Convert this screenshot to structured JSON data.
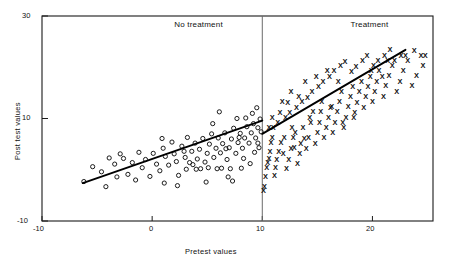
{
  "chart_data": {
    "type": "scatter",
    "title": "",
    "xlabel": "Pretest values",
    "ylabel": "Post test values",
    "xlim": [
      -10,
      25.5
    ],
    "ylim": [
      -10,
      30
    ],
    "xticks": [
      -10,
      0,
      10,
      20
    ],
    "xtick_labels": [
      "-10",
      "0",
      "10",
      "20"
    ],
    "yticks": [
      -10,
      10,
      30
    ],
    "ytick_labels": [
      "-10",
      "10",
      "30"
    ],
    "grid": false,
    "legend": "none",
    "cutoff": {
      "x": 10,
      "label": "vertical-cutoff-line"
    },
    "panels": [
      {
        "name": "No treatment",
        "label": "No treatment",
        "label_x": 2.0,
        "label_y": 28.2,
        "marker": "circle"
      },
      {
        "name": "Treatment",
        "label": "Treatment",
        "label_x": 18.0,
        "label_y": 28.2,
        "marker": "x"
      }
    ],
    "series": [
      {
        "name": "No treatment",
        "marker": "o",
        "points": [
          [
            -6.2,
            -2.3
          ],
          [
            -5.4,
            0.6
          ],
          [
            -4.6,
            -0.4
          ],
          [
            -4.2,
            -3.3
          ],
          [
            -3.4,
            1.1
          ],
          [
            -3.2,
            -1.4
          ],
          [
            -2.6,
            2.2
          ],
          [
            -2.2,
            -0.9
          ],
          [
            -1.8,
            1.4
          ],
          [
            -1.5,
            -2.0
          ],
          [
            -1.2,
            3.4
          ],
          [
            -0.9,
            0.4
          ],
          [
            -0.6,
            2.0
          ],
          [
            -0.2,
            -1.3
          ],
          [
            0.1,
            3.2
          ],
          [
            0.4,
            1.1
          ],
          [
            0.7,
            -0.2
          ],
          [
            1.0,
            4.2
          ],
          [
            1.2,
            2.6
          ],
          [
            1.5,
            0.9
          ],
          [
            1.8,
            5.4
          ],
          [
            2.0,
            3.1
          ],
          [
            2.2,
            1.6
          ],
          [
            2.4,
            -1.1
          ],
          [
            2.7,
            4.6
          ],
          [
            3.0,
            2.4
          ],
          [
            3.2,
            6.3
          ],
          [
            3.4,
            1.4
          ],
          [
            3.6,
            3.6
          ],
          [
            3.9,
            5.2
          ],
          [
            4.1,
            2.1
          ],
          [
            4.3,
            4.0
          ],
          [
            4.6,
            6.1
          ],
          [
            4.8,
            1.5
          ],
          [
            5.0,
            3.2
          ],
          [
            5.2,
            5.0
          ],
          [
            5.4,
            7.0
          ],
          [
            5.6,
            2.4
          ],
          [
            5.8,
            4.2
          ],
          [
            6.0,
            6.2
          ],
          [
            6.2,
            3.3
          ],
          [
            6.4,
            5.1
          ],
          [
            6.6,
            7.2
          ],
          [
            6.8,
            2.0
          ],
          [
            7.0,
            4.3
          ],
          [
            7.2,
            6.0
          ],
          [
            7.4,
            8.1
          ],
          [
            7.6,
            3.2
          ],
          [
            7.8,
            5.3
          ],
          [
            8.0,
            7.1
          ],
          [
            8.2,
            4.2
          ],
          [
            8.4,
            6.2
          ],
          [
            8.6,
            8.4
          ],
          [
            8.8,
            5.2
          ],
          [
            9.0,
            7.2
          ],
          [
            9.2,
            9.0
          ],
          [
            9.4,
            6.2
          ],
          [
            9.6,
            8.2
          ],
          [
            9.8,
            9.9
          ],
          [
            9.9,
            7.4
          ],
          [
            2.9,
            3.6
          ],
          [
            3.7,
            1.0
          ],
          [
            4.4,
            0.2
          ],
          [
            5.1,
            0.4
          ],
          [
            5.9,
            0.2
          ],
          [
            6.3,
            0.3
          ],
          [
            7.1,
            0.2
          ],
          [
            6.9,
            -1.4
          ],
          [
            8.1,
            0.3
          ],
          [
            8.9,
            1.2
          ],
          [
            9.3,
            3.4
          ],
          [
            9.7,
            4.3
          ],
          [
            1.1,
            -2.6
          ],
          [
            2.3,
            -3.1
          ],
          [
            4.9,
            -2.4
          ],
          [
            7.3,
            -2.2
          ],
          [
            5.5,
            9.0
          ],
          [
            6.1,
            11.3
          ],
          [
            7.7,
            10.0
          ],
          [
            8.5,
            10.1
          ],
          [
            9.1,
            11.0
          ],
          [
            9.5,
            12.1
          ],
          [
            3.1,
            0.1
          ],
          [
            4.0,
            0.1
          ],
          [
            6.7,
            4.1
          ],
          [
            7.9,
            6.3
          ],
          [
            8.3,
            2.2
          ],
          [
            9.6,
            5.2
          ],
          [
            -3.9,
            2.3
          ],
          [
            -2.9,
            3.1
          ],
          [
            0.9,
            6.1
          ]
        ],
        "fit_line": {
          "x0": -6.3,
          "y0": -2.6,
          "x1": 10.0,
          "y1": 9.6
        }
      },
      {
        "name": "Treatment",
        "marker": "x",
        "points": [
          [
            10.1,
            -4.0
          ],
          [
            10.2,
            -3.2
          ],
          [
            10.3,
            -1.2
          ],
          [
            10.4,
            0.4
          ],
          [
            10.5,
            1.4
          ],
          [
            10.6,
            2.2
          ],
          [
            10.7,
            3.6
          ],
          [
            10.8,
            5.4
          ],
          [
            10.9,
            6.4
          ],
          [
            11.1,
            -1.1
          ],
          [
            11.2,
            0.4
          ],
          [
            11.3,
            2.0
          ],
          [
            11.5,
            3.6
          ],
          [
            11.7,
            5.3
          ],
          [
            12.0,
            6.4
          ],
          [
            12.2,
            0.3
          ],
          [
            12.4,
            2.1
          ],
          [
            12.6,
            4.2
          ],
          [
            12.8,
            6.3
          ],
          [
            13.0,
            7.3
          ],
          [
            13.2,
            1.2
          ],
          [
            13.4,
            3.2
          ],
          [
            13.5,
            5.2
          ],
          [
            13.7,
            8.2
          ],
          [
            14.0,
            4.2
          ],
          [
            14.2,
            6.3
          ],
          [
            14.4,
            9.2
          ],
          [
            14.6,
            11.3
          ],
          [
            14.8,
            5.2
          ],
          [
            15.0,
            7.2
          ],
          [
            15.2,
            9.3
          ],
          [
            15.4,
            13.3
          ],
          [
            15.6,
            6.3
          ],
          [
            15.8,
            8.2
          ],
          [
            16.0,
            10.2
          ],
          [
            16.2,
            12.2
          ],
          [
            16.4,
            7.2
          ],
          [
            16.6,
            9.2
          ],
          [
            16.8,
            11.3
          ],
          [
            17.0,
            13.3
          ],
          [
            17.2,
            15.3
          ],
          [
            17.4,
            8.2
          ],
          [
            17.6,
            10.2
          ],
          [
            17.8,
            12.3
          ],
          [
            18.0,
            14.3
          ],
          [
            18.2,
            16.2
          ],
          [
            18.4,
            11.2
          ],
          [
            18.6,
            13.2
          ],
          [
            18.8,
            15.3
          ],
          [
            19.0,
            17.3
          ],
          [
            19.2,
            12.2
          ],
          [
            19.4,
            14.3
          ],
          [
            19.6,
            16.3
          ],
          [
            19.8,
            18.3
          ],
          [
            20.0,
            13.3
          ],
          [
            20.2,
            15.3
          ],
          [
            20.4,
            17.3
          ],
          [
            20.6,
            19.3
          ],
          [
            21.0,
            14.3
          ],
          [
            21.2,
            16.4
          ],
          [
            21.5,
            18.4
          ],
          [
            21.8,
            20.3
          ],
          [
            22.2,
            15.3
          ],
          [
            22.5,
            17.3
          ],
          [
            22.8,
            19.4
          ],
          [
            23.2,
            21.3
          ],
          [
            23.6,
            16.4
          ],
          [
            24.0,
            18.4
          ],
          [
            24.4,
            22.4
          ],
          [
            24.8,
            22.3
          ],
          [
            11.0,
            8.2
          ],
          [
            11.4,
            9.3
          ],
          [
            12.1,
            10.2
          ],
          [
            12.5,
            11.2
          ],
          [
            13.1,
            12.2
          ],
          [
            13.6,
            13.3
          ],
          [
            14.1,
            14.2
          ],
          [
            14.5,
            15.2
          ],
          [
            15.1,
            16.2
          ],
          [
            15.5,
            17.3
          ],
          [
            16.1,
            18.3
          ],
          [
            16.5,
            19.3
          ],
          [
            17.1,
            20.3
          ],
          [
            17.5,
            21.2
          ],
          [
            18.1,
            19.2
          ],
          [
            18.5,
            20.2
          ],
          [
            19.1,
            21.3
          ],
          [
            19.5,
            22.3
          ],
          [
            20.1,
            20.3
          ],
          [
            20.5,
            21.3
          ],
          [
            21.1,
            22.3
          ],
          [
            21.6,
            23.4
          ],
          [
            12.3,
            13.2
          ],
          [
            13.3,
            14.3
          ],
          [
            11.6,
            11.2
          ],
          [
            12.7,
            8.3
          ],
          [
            14.3,
            10.3
          ],
          [
            15.3,
            11.3
          ],
          [
            16.3,
            12.3
          ],
          [
            17.3,
            9.2
          ],
          [
            18.3,
            10.3
          ],
          [
            13.8,
            6.2
          ],
          [
            12.9,
            4.3
          ],
          [
            11.9,
            3.2
          ],
          [
            10.6,
            8.3
          ],
          [
            10.9,
            10.2
          ],
          [
            11.8,
            13.3
          ],
          [
            12.6,
            15.3
          ],
          [
            13.9,
            17.3
          ],
          [
            14.9,
            18.3
          ],
          [
            15.9,
            19.3
          ],
          [
            16.9,
            17.2
          ],
          [
            19.9,
            19.4
          ],
          [
            20.9,
            18.3
          ],
          [
            22.0,
            21.3
          ],
          [
            23.0,
            22.4
          ],
          [
            24.6,
            20.3
          ],
          [
            23.8,
            23.3
          ],
          [
            22.6,
            22.3
          ],
          [
            21.4,
            21.4
          ]
        ],
        "fit_line": {
          "x0": 10.0,
          "y0": 7.0,
          "x1": 23.0,
          "y1": 23.4
        }
      }
    ]
  },
  "axes": {
    "xlabel": "Pretest values",
    "ylabel": "Post test values",
    "xtick_labels": [
      "-10",
      "0",
      "10",
      "20"
    ],
    "ytick_labels": [
      "30",
      "10",
      "-10"
    ]
  },
  "panel_labels": {
    "left": "No treatment",
    "right": "Treatment"
  },
  "colors": {
    "axis": "#1a1a1a",
    "marker": "#111111",
    "fit_line": "#000000",
    "divider": "#555555",
    "background": "#ffffff"
  }
}
